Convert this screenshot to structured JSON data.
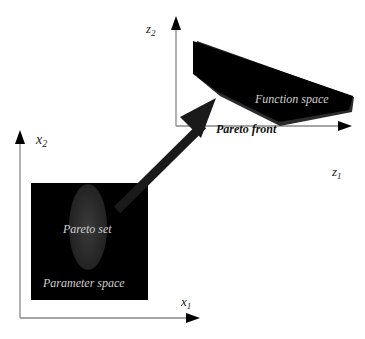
{
  "diagram": {
    "type": "pareto-mapping",
    "parameter_space": {
      "label": "Parameter space",
      "inner_region_label": "Pareto set",
      "x_axis_label": "x",
      "x_axis_subscript": "1",
      "y_axis_label": "x",
      "y_axis_subscript": "2"
    },
    "function_space": {
      "label": "Function space",
      "boundary_label": "Pareto front",
      "x_axis_label": "z",
      "x_axis_subscript": "1",
      "y_axis_label": "z",
      "y_axis_subscript": "2"
    },
    "colors": {
      "region_fill": "#000000",
      "pareto_set_fill": "#2a2a2a",
      "axis": "#888888",
      "arrow": "#1a1a1a",
      "text_on_dark": "#d0d0d0",
      "text_on_light": "#111111"
    }
  }
}
